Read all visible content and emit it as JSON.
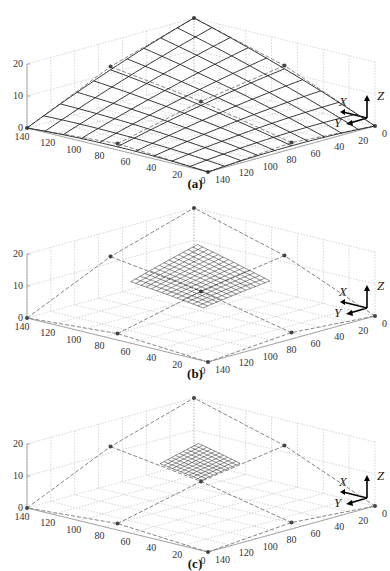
{
  "chart_data": [
    {
      "panel": "(a)",
      "type": "surface3d",
      "title": "",
      "caption": "(a)",
      "xlabel": "X",
      "ylabel": "Y",
      "zlabel": "Z",
      "x_ticks": [
        0,
        20,
        40,
        60,
        80,
        100,
        120,
        140
      ],
      "y_ticks": [
        140,
        120,
        100,
        80,
        60,
        40,
        20,
        0
      ],
      "z_ticks": [
        0,
        10,
        20
      ],
      "xlim": [
        0,
        140
      ],
      "ylim": [
        0,
        140
      ],
      "zlim": [
        0,
        20
      ],
      "grid": true,
      "description": "Large mesh surface spanning the whole control net; peak at rear corner (~z=20), drooping toward front corners (~z=0)",
      "control_points": [
        {
          "x": 0,
          "y": 0,
          "z": 20
        },
        {
          "x": 70,
          "y": 0,
          "z": 12
        },
        {
          "x": 140,
          "y": 0,
          "z": 0
        },
        {
          "x": 0,
          "y": 70,
          "z": 12
        },
        {
          "x": 70,
          "y": 70,
          "z": 8
        },
        {
          "x": 140,
          "y": 70,
          "z": 2
        },
        {
          "x": 0,
          "y": 140,
          "z": 0
        },
        {
          "x": 70,
          "y": 140,
          "z": 2
        },
        {
          "x": 140,
          "y": 140,
          "z": 0
        }
      ]
    },
    {
      "panel": "(b)",
      "type": "surface3d",
      "caption": "(b)",
      "xlabel": "X",
      "ylabel": "Y",
      "zlabel": "Z",
      "x_ticks": [
        0,
        20,
        40,
        60,
        80,
        100,
        120,
        140
      ],
      "y_ticks": [
        140,
        120,
        100,
        80,
        60,
        40,
        20,
        0
      ],
      "z_ticks": [
        0,
        10,
        20
      ],
      "xlim": [
        0,
        140
      ],
      "ylim": [
        0,
        140
      ],
      "zlim": [
        0,
        20
      ],
      "grid": true,
      "description": "Dashed control polygon with peak ~z=20 and a small dense mesh patch near center at ~z=13-15"
    },
    {
      "panel": "(c)",
      "type": "surface3d",
      "caption": "(c)",
      "xlabel": "X",
      "ylabel": "Y",
      "zlabel": "Z",
      "x_ticks": [
        0,
        20,
        40,
        60,
        80,
        100,
        120,
        140
      ],
      "y_ticks": [
        140,
        120,
        100,
        80,
        60,
        40,
        20,
        0
      ],
      "z_ticks": [
        0,
        10,
        20
      ],
      "xlim": [
        0,
        140
      ],
      "ylim": [
        0,
        140
      ],
      "zlim": [
        0,
        20
      ],
      "grid": true,
      "description": "Dashed control polygon with peak ~z=20 and a very small dense mesh patch near center at ~z=14"
    }
  ],
  "panels": [
    {
      "caption": "(a)",
      "left_ticks": [
        "140",
        "120",
        "100",
        "80",
        "60",
        "40",
        "20",
        "0"
      ],
      "right_ticks": [
        "140",
        "120",
        "100",
        "80",
        "60",
        "40",
        "20",
        "0"
      ],
      "z_ticks": [
        "20",
        "10",
        "0"
      ],
      "axes": {
        "x": "X",
        "y": "Y",
        "z": "Z"
      }
    },
    {
      "caption": "(b)",
      "left_ticks": [
        "140",
        "120",
        "100",
        "80",
        "60",
        "40",
        "20",
        "0"
      ],
      "right_ticks": [
        "140",
        "120",
        "100",
        "80",
        "60",
        "40",
        "20",
        "0"
      ],
      "z_ticks": [
        "20",
        "10",
        "0"
      ],
      "axes": {
        "x": "X",
        "y": "Y",
        "z": "Z"
      }
    },
    {
      "caption": "(c)",
      "left_ticks": [
        "140",
        "120",
        "100",
        "80",
        "60",
        "40",
        "20",
        "0"
      ],
      "right_ticks": [
        "140",
        "120",
        "100",
        "80",
        "60",
        "40",
        "20",
        "0"
      ],
      "z_ticks": [
        "20",
        "10",
        "0"
      ],
      "axes": {
        "x": "X",
        "y": "Y",
        "z": "Z"
      }
    }
  ],
  "colors": {
    "mesh": "#222222",
    "grid": "#b8b8b8",
    "control": "#777777",
    "point": "#444444"
  }
}
